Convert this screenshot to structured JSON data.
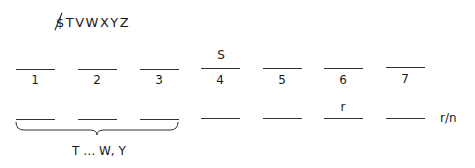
{
  "header": {
    "alphabet_label": "$TVWXYZ",
    "struck_letter": "S"
  },
  "top_row": {
    "slots": [
      {
        "number": "1",
        "above": ""
      },
      {
        "number": "2",
        "above": ""
      },
      {
        "number": "3",
        "above": ""
      },
      {
        "number": "4",
        "above": "S"
      },
      {
        "number": "5",
        "above": ""
      },
      {
        "number": "6",
        "above": ""
      },
      {
        "number": "7",
        "above": ""
      }
    ]
  },
  "bottom_row": {
    "slots": [
      {
        "above": ""
      },
      {
        "above": ""
      },
      {
        "above": ""
      },
      {
        "above": ""
      },
      {
        "above": ""
      },
      {
        "above": "r"
      },
      {
        "above": ""
      }
    ],
    "end_label": "r/n",
    "brace_label": "T … W, Y"
  }
}
